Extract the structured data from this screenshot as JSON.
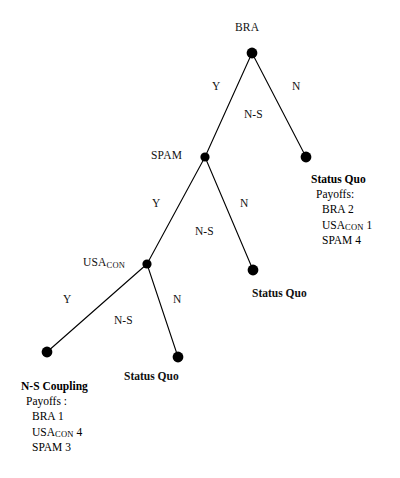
{
  "figure": {
    "type": "extensive-form-game-tree",
    "background_color": "#ffffff",
    "ink_color": "#000000"
  },
  "nodes": {
    "bra": {
      "label": "BRA",
      "x": 252,
      "y": 53
    },
    "spam": {
      "label": "SPAM",
      "x": 205,
      "y": 157
    },
    "usacon": {
      "label_main": "USA",
      "label_sub": "CON",
      "x": 147,
      "y": 264
    },
    "terminal_top_right": {
      "x": 306,
      "y": 157
    },
    "terminal_mid_right": {
      "x": 253,
      "y": 270
    },
    "terminal_bottom_mid": {
      "x": 178,
      "y": 357
    },
    "terminal_bottom_left": {
      "x": 47,
      "y": 352
    }
  },
  "edges": {
    "bra_yes": {
      "action": "Y",
      "branch": "N-S"
    },
    "bra_no": {
      "action": "N"
    },
    "spam_yes": {
      "action": "Y",
      "branch": "N-S"
    },
    "spam_no": {
      "action": "N"
    },
    "usacon_yes": {
      "action": "Y",
      "branch": "N-S"
    },
    "usacon_no": {
      "action": "N"
    }
  },
  "outcomes": {
    "status_quo_top_right": {
      "title": "Status Quo",
      "payoffs_head": "Payoffs:",
      "rows": [
        {
          "player": "BRA",
          "value": "2"
        },
        {
          "player": "USA",
          "sub": "CON",
          "value": "1"
        },
        {
          "player": "SPAM",
          "value": "4"
        }
      ]
    },
    "status_quo_mid_right": {
      "title": "Status Quo"
    },
    "status_quo_bottom_mid": {
      "title": "Status Quo"
    },
    "ns_coupling_bottom_left": {
      "title": "N-S Coupling",
      "payoffs_head": "Payoffs :",
      "rows": [
        {
          "player": "BRA",
          "value": "1"
        },
        {
          "player": "USA",
          "sub": "CON",
          "value": "4"
        },
        {
          "player": "SPAM",
          "value": "3"
        }
      ]
    }
  }
}
